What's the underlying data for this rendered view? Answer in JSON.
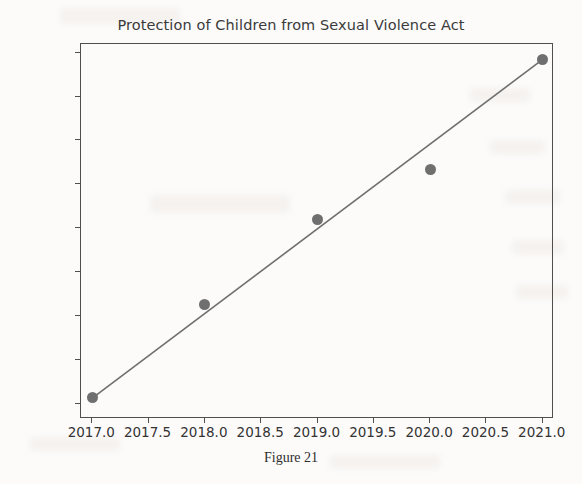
{
  "page": {
    "title": "Protection of Children from Sexual Violence Act",
    "caption": "Figure 21",
    "background_color": "#fcfbfa"
  },
  "chart_data": {
    "type": "scatter",
    "title": "Protection of Children from Sexual Violence Act",
    "xlabel": "",
    "ylabel": "",
    "x": [
      2017,
      2018,
      2019,
      2020,
      2021
    ],
    "values": [
      16300,
      20500,
      24400,
      26700,
      31700
    ],
    "series": [
      {
        "name": "Cases registered",
        "marker": "circle",
        "color": "#6f6f6f",
        "x": [
          2017,
          2018,
          2019,
          2020,
          2021
        ],
        "values": [
          16300,
          20500,
          24400,
          26700,
          31700
        ]
      },
      {
        "name": "Trend line",
        "type": "line",
        "color": "#6f6f6f",
        "x": [
          2017,
          2021
        ],
        "values": [
          16250,
          31700
        ]
      }
    ],
    "xlim": [
      2016.9,
      2021.1
    ],
    "ylim": [
      15300,
      32400
    ],
    "xticks": [
      2017.0,
      2017.5,
      2018.0,
      2018.5,
      2019.0,
      2019.5,
      2020.0,
      2020.5,
      2021.0
    ],
    "xtick_labels": [
      "2017.0",
      "2017.5",
      "2018.0",
      "2018.5",
      "2019.0",
      "2019.5",
      "2020.0",
      "2020.5",
      "2021.0"
    ],
    "yticks": [
      16000,
      18000,
      20000,
      22000,
      24000,
      26000,
      28000,
      30000,
      32000
    ],
    "ytick_labels": [
      "16000",
      "18000",
      "20000",
      "22000",
      "24000",
      "26000",
      "28000",
      "30000",
      "32000"
    ],
    "grid": false,
    "legend": null
  }
}
